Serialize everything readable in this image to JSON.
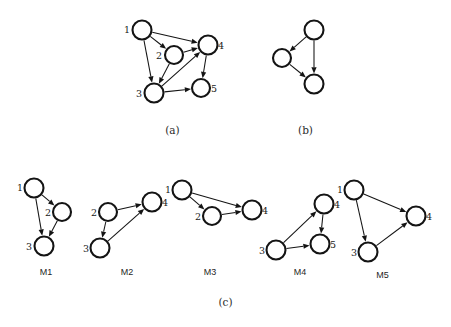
{
  "figure": {
    "panels": [
      {
        "id": "panel-a",
        "caption": "(a)",
        "nodes": [
          {
            "id": "1",
            "label": "1",
            "cx": 32,
            "cy": 22,
            "r": 9.5,
            "label_dx": -15,
            "label_dy": 3
          },
          {
            "id": "2",
            "label": "2",
            "cx": 64,
            "cy": 47,
            "r": 9.0,
            "label_dx": -15,
            "label_dy": 4
          },
          {
            "id": "4",
            "label": "4",
            "cx": 98,
            "cy": 37,
            "r": 9.5,
            "label_dx": 13,
            "label_dy": 4
          },
          {
            "id": "3",
            "label": "3",
            "cx": 44,
            "cy": 85,
            "r": 9.5,
            "label_dx": -15,
            "label_dy": 4
          },
          {
            "id": "5",
            "label": "5",
            "cx": 91,
            "cy": 80,
            "r": 9.0,
            "label_dx": 13,
            "label_dy": 4
          }
        ],
        "edges": [
          {
            "from": "1",
            "to": "2"
          },
          {
            "from": "1",
            "to": "4"
          },
          {
            "from": "1",
            "to": "3"
          },
          {
            "from": "2",
            "to": "4"
          },
          {
            "from": "2",
            "to": "3"
          },
          {
            "from": "3",
            "to": "4"
          },
          {
            "from": "3",
            "to": "5"
          },
          {
            "from": "4",
            "to": "5"
          }
        ]
      },
      {
        "id": "panel-b",
        "caption": "(b)",
        "nodes": [
          {
            "id": "t",
            "label": "",
            "cx": 56,
            "cy": 22,
            "r": 9.5,
            "label_dx": 0,
            "label_dy": 0
          },
          {
            "id": "l",
            "label": "",
            "cx": 24,
            "cy": 50,
            "r": 9.0,
            "label_dx": 0,
            "label_dy": 0
          },
          {
            "id": "b",
            "label": "",
            "cx": 56,
            "cy": 76,
            "r": 9.5,
            "label_dx": 0,
            "label_dy": 0
          }
        ],
        "edges": [
          {
            "from": "t",
            "to": "l"
          },
          {
            "from": "t",
            "to": "b"
          },
          {
            "from": "l",
            "to": "b"
          }
        ]
      }
    ],
    "motifs_caption": "(c)",
    "motifs": [
      {
        "id": "M1",
        "caption": "M1",
        "nodes": [
          {
            "id": "1",
            "label": "1",
            "cx": 28,
            "cy": 18,
            "r": 9.5,
            "label_dx": -14,
            "label_dy": 3
          },
          {
            "id": "2",
            "label": "2",
            "cx": 56,
            "cy": 42,
            "r": 9.0,
            "label_dx": -14,
            "label_dy": 4
          },
          {
            "id": "3",
            "label": "3",
            "cx": 38,
            "cy": 76,
            "r": 9.5,
            "label_dx": -15,
            "label_dy": 4
          }
        ],
        "edges": [
          {
            "from": "1",
            "to": "2"
          },
          {
            "from": "1",
            "to": "3"
          },
          {
            "from": "2",
            "to": "3"
          }
        ]
      },
      {
        "id": "M2",
        "caption": "M2",
        "nodes": [
          {
            "id": "2",
            "label": "2",
            "cx": 26,
            "cy": 32,
            "r": 9.0,
            "label_dx": -14,
            "label_dy": 4
          },
          {
            "id": "4",
            "label": "4",
            "cx": 70,
            "cy": 22,
            "r": 9.5,
            "label_dx": 13,
            "label_dy": 4
          },
          {
            "id": "3",
            "label": "3",
            "cx": 18,
            "cy": 68,
            "r": 9.5,
            "label_dx": -14,
            "label_dy": 4
          }
        ],
        "edges": [
          {
            "from": "2",
            "to": "4"
          },
          {
            "from": "2",
            "to": "3"
          },
          {
            "from": "3",
            "to": "4"
          }
        ]
      },
      {
        "id": "M3",
        "caption": "M3",
        "nodes": [
          {
            "id": "1",
            "label": "1",
            "cx": 22,
            "cy": 18,
            "r": 9.5,
            "label_dx": -14,
            "label_dy": 3
          },
          {
            "id": "2",
            "label": "2",
            "cx": 52,
            "cy": 44,
            "r": 9.0,
            "label_dx": -14,
            "label_dy": 4
          },
          {
            "id": "4",
            "label": "4",
            "cx": 92,
            "cy": 38,
            "r": 9.5,
            "label_dx": 13,
            "label_dy": 4
          }
        ],
        "edges": [
          {
            "from": "1",
            "to": "2"
          },
          {
            "from": "1",
            "to": "4"
          },
          {
            "from": "2",
            "to": "4"
          }
        ]
      },
      {
        "id": "M4",
        "caption": "M4",
        "nodes": [
          {
            "id": "4",
            "label": "4",
            "cx": 66,
            "cy": 22,
            "r": 9.5,
            "label_dx": 13,
            "label_dy": 4
          },
          {
            "id": "5",
            "label": "5",
            "cx": 62,
            "cy": 62,
            "r": 9.5,
            "label_dx": 13,
            "label_dy": 4
          },
          {
            "id": "3",
            "label": "3",
            "cx": 18,
            "cy": 68,
            "r": 9.5,
            "label_dx": -14,
            "label_dy": 4
          }
        ],
        "edges": [
          {
            "from": "3",
            "to": "4"
          },
          {
            "from": "4",
            "to": "5"
          },
          {
            "from": "3",
            "to": "5"
          }
        ]
      },
      {
        "id": "M5",
        "caption": "M5",
        "nodes": [
          {
            "id": "1",
            "label": "1",
            "cx": 22,
            "cy": 18,
            "r": 9.5,
            "label_dx": -14,
            "label_dy": 3
          },
          {
            "id": "4",
            "label": "4",
            "cx": 84,
            "cy": 44,
            "r": 9.5,
            "label_dx": 13,
            "label_dy": 4
          },
          {
            "id": "3",
            "label": "3",
            "cx": 36,
            "cy": 80,
            "r": 9.5,
            "label_dx": -14,
            "label_dy": 4
          }
        ],
        "edges": [
          {
            "from": "1",
            "to": "4"
          },
          {
            "from": "1",
            "to": "3"
          },
          {
            "from": "3",
            "to": "4"
          }
        ]
      }
    ],
    "colors": {
      "ink": "#141414",
      "node_fill": "#ffffff",
      "background": "#ffffff",
      "caption": "#2b2b2b"
    }
  },
  "layout": {
    "panel_a": {
      "left": 110,
      "top": 8,
      "width": 125,
      "height": 110,
      "caption_left": 110,
      "caption_top": 124,
      "caption_width": 125
    },
    "panel_b": {
      "left": 258,
      "top": 8,
      "width": 95,
      "height": 110,
      "caption_left": 258,
      "caption_top": 124,
      "caption_width": 95
    },
    "motif_M1": {
      "left": 6,
      "top": 170,
      "width": 80,
      "height": 95,
      "caption_left": 6,
      "caption_top": 267,
      "caption_width": 80
    },
    "motif_M2": {
      "left": 82,
      "top": 180,
      "width": 90,
      "height": 90,
      "caption_left": 82,
      "caption_top": 267,
      "caption_width": 90
    },
    "motif_M3": {
      "left": 160,
      "top": 172,
      "width": 110,
      "height": 95,
      "caption_left": 155,
      "caption_top": 267,
      "caption_width": 110
    },
    "motif_M4": {
      "left": 258,
      "top": 182,
      "width": 90,
      "height": 90,
      "caption_left": 255,
      "caption_top": 267,
      "caption_width": 90
    },
    "motif_M5": {
      "left": 332,
      "top": 172,
      "width": 105,
      "height": 100,
      "caption_left": 330,
      "caption_top": 270,
      "caption_width": 105
    },
    "caption_c": {
      "left": 0,
      "top": 296,
      "width": 451
    }
  }
}
